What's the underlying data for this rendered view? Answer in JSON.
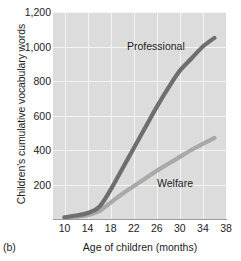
{
  "panel": {
    "label": "(b)"
  },
  "chart_data": {
    "type": "line",
    "title": "",
    "xlabel": "Age of children (months)",
    "ylabel": "Children's cumulative vocabulary words",
    "xlim": [
      8,
      38
    ],
    "ylim": [
      0,
      1200
    ],
    "xticks": [
      10,
      14,
      18,
      22,
      26,
      30,
      34,
      38
    ],
    "xtick_labels": [
      "10",
      "14",
      "18",
      "22",
      "26",
      "30",
      "34",
      "38"
    ],
    "yticks": [
      200,
      400,
      600,
      800,
      1000,
      1200
    ],
    "ytick_labels": [
      "200",
      "400",
      "600",
      "800",
      "1,000",
      "1,200"
    ],
    "grid": true,
    "grid_color": "#f4f4f4",
    "plot_background": "#dcdcdc",
    "legend_position": "inline-annotation",
    "series": [
      {
        "name": "Professional",
        "color": "#6e6e6e",
        "x": [
          10,
          12,
          14,
          16,
          18,
          20,
          22,
          24,
          26,
          28,
          30,
          32,
          34,
          36
        ],
        "values": [
          10,
          20,
          35,
          70,
          170,
          290,
          410,
          530,
          650,
          760,
          860,
          930,
          1000,
          1050
        ]
      },
      {
        "name": "Welfare",
        "color": "#a9a9a9",
        "x": [
          10,
          12,
          14,
          16,
          18,
          20,
          22,
          24,
          26,
          28,
          30,
          32,
          34,
          36
        ],
        "values": [
          8,
          14,
          22,
          45,
          95,
          145,
          190,
          235,
          280,
          320,
          360,
          400,
          435,
          470
        ]
      }
    ]
  }
}
